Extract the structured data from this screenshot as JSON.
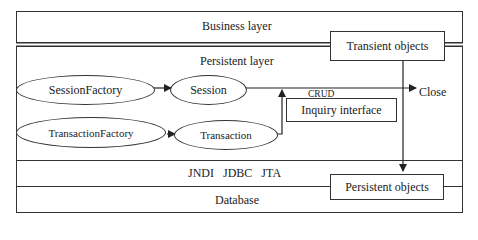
{
  "layers": {
    "business": "Business layer",
    "persistent": "Persistent layer",
    "middleware": "JNDI   JDBC   JTA",
    "database": "Database"
  },
  "nodes": {
    "session_factory": "SessionFactory",
    "session": "Session",
    "transaction_factory": "TransactionFactory",
    "transaction": "Transaction",
    "inquiry_interface": "Inquiry interface",
    "transient_objects": "Transient objects",
    "persistent_objects": "Persistent objects"
  },
  "edges": {
    "crud": "CRUD",
    "close": "Close"
  }
}
